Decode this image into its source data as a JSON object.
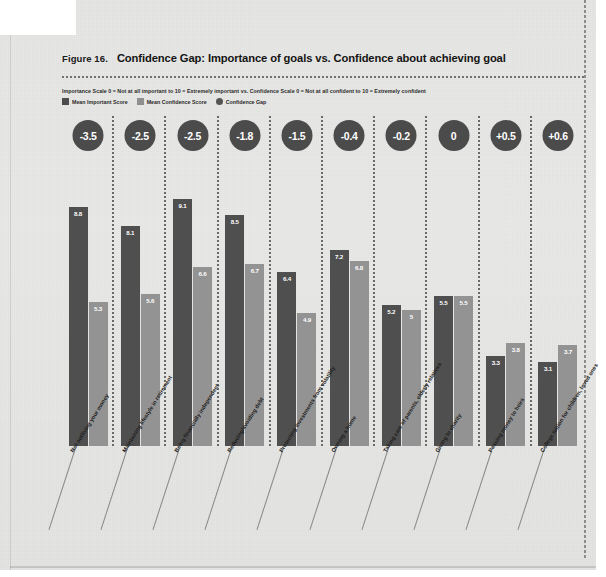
{
  "figure": {
    "number": "Figure 16.",
    "title": "Confidence Gap: Importance of goals vs. Confidence about achieving goal",
    "scale_note": "Importance Scale 0 = Not at all important to 10 = Extremely important  vs. Confidence Scale 0 = Not at all confident to 10 = Extremely confident"
  },
  "legend": {
    "items": [
      {
        "label": "Mean Important Score",
        "swatch": "square",
        "color": "#4d4d4d"
      },
      {
        "label": "Mean Confidence Score",
        "swatch": "square",
        "color": "#8f8f8f"
      },
      {
        "label": "Confidence Gap",
        "swatch": "circle",
        "color": "#555555"
      }
    ]
  },
  "colors": {
    "important_bar": "#4f4f4f",
    "confidence_bar": "#939393",
    "gap_bubble": "#4b4b4b",
    "page_background": "#e6e6e4",
    "text": "#1b1b1b"
  },
  "chart_data": {
    "type": "bar",
    "title": "Confidence Gap: Importance of goals vs. Confidence about achieving goal",
    "subtitle": "Importance Scale 0 = Not at all important to 10 = Extremely important  vs. Confidence Scale 0 = Not at all confident to 10 = Extremely confident",
    "xlabel": "",
    "ylabel": "",
    "ylim": [
      0,
      10
    ],
    "grid": false,
    "legend_position": "top-left",
    "categories": [
      "Not outliving your money",
      "Maintaining lifestyle in retirement",
      "Being financially independent",
      "Reducing/avoiding debt",
      "Protecting investments from volatility",
      "Owning a home",
      "Taking care of parents, elderly relatives",
      "Giving to charity",
      "Passing money to heirs",
      "College tuition for children, loved ones"
    ],
    "series": [
      {
        "name": "Mean Important Score",
        "values": [
          8.8,
          8.1,
          9.1,
          8.5,
          6.4,
          7.2,
          5.2,
          5.5,
          3.3,
          3.1
        ]
      },
      {
        "name": "Mean Confidence Score",
        "values": [
          5.3,
          5.6,
          6.6,
          6.7,
          4.9,
          6.8,
          5.0,
          5.5,
          3.8,
          3.7
        ]
      }
    ],
    "annotations": {
      "name": "Confidence Gap",
      "values": [
        "-3.5",
        "-2.5",
        "-2.5",
        "-1.8",
        "-1.5",
        "-0.4",
        "-0.2",
        "0",
        "+0.5",
        "+0.6"
      ]
    },
    "value_labels": {
      "important": [
        "8.8",
        "8.1",
        "9.1",
        "8.5",
        "6.4",
        "7.2",
        "5.2",
        "5.5",
        "3.3",
        "3.1"
      ],
      "confidence": [
        "5.3",
        "5.6",
        "6.6",
        "6.7",
        "4.9",
        "6.8",
        "5",
        "5.5",
        "3.8",
        "3.7"
      ]
    }
  }
}
